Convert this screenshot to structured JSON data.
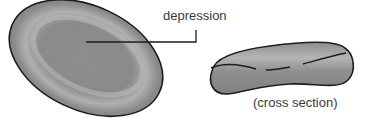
{
  "diagram": {
    "labels": {
      "depression": "depression",
      "cross_section": "(cross section)"
    },
    "colors": {
      "cell_fill": "#8c8c8c",
      "cell_highlight": "#b4b4b4",
      "outline": "#1e1e1e",
      "label_text": "#3a3a3a",
      "background": "#ffffff"
    },
    "parts": [
      {
        "name": "top-view-cell",
        "description": "oval biconcave disc seen from above"
      },
      {
        "name": "cross-section-cell",
        "description": "dumbbell-shaped side profile"
      }
    ]
  }
}
